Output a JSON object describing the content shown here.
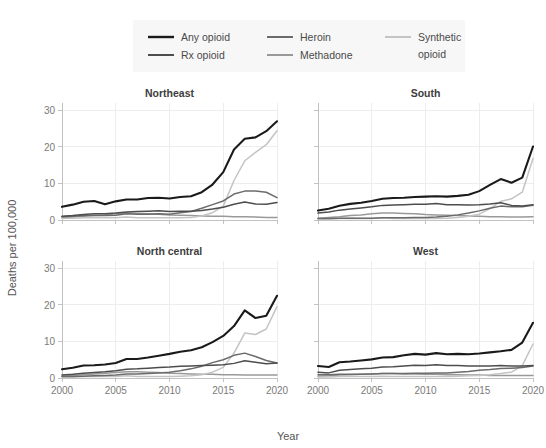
{
  "chart_data": {
    "type": "line",
    "title": "",
    "xlabel": "Year",
    "ylabel": "Deaths per 100,000",
    "xlim": [
      2000,
      2020
    ],
    "ylim": [
      0,
      32
    ],
    "grid": true,
    "legend_position": "top",
    "xticks": [
      2000,
      2005,
      2010,
      2015,
      2020
    ],
    "xtick_labels": [
      "2000",
      "2005",
      "2010",
      "2015",
      "2020"
    ],
    "yticks": [
      0,
      10,
      20,
      30
    ],
    "ytick_labels": [
      "0",
      "10",
      "20",
      "30"
    ],
    "x": [
      2000,
      2001,
      2002,
      2003,
      2004,
      2005,
      2006,
      2007,
      2008,
      2009,
      2010,
      2011,
      2012,
      2013,
      2014,
      2015,
      2016,
      2017,
      2018,
      2019,
      2020
    ],
    "series_names": [
      "Any opioid",
      "Rx opioid",
      "Heroin",
      "Methadone",
      "Synthetic opioid"
    ],
    "series_colors": {
      "Any opioid": "#1a1a1a",
      "Rx opioid": "#4d4d4d",
      "Heroin": "#6b6b6b",
      "Methadone": "#999999",
      "Synthetic opioid": "#c4c4c4"
    },
    "panels": [
      {
        "name": "Northeast",
        "row": 0,
        "col": 0,
        "series": [
          {
            "name": "Any opioid",
            "values": [
              3.6,
              4.2,
              5.0,
              5.2,
              4.3,
              5.1,
              5.6,
              5.6,
              6.0,
              6.1,
              5.9,
              6.3,
              6.5,
              7.6,
              9.7,
              13.1,
              19.3,
              22.2,
              22.6,
              24.3,
              27.0
            ]
          },
          {
            "name": "Rx opioid",
            "values": [
              1.0,
              1.2,
              1.5,
              1.7,
              1.7,
              1.9,
              2.2,
              2.3,
              2.4,
              2.5,
              2.3,
              2.4,
              2.4,
              2.6,
              3.0,
              3.5,
              4.3,
              4.9,
              4.4,
              4.3,
              4.8
            ]
          },
          {
            "name": "Heroin",
            "values": [
              0.9,
              1.0,
              1.2,
              1.2,
              1.2,
              1.3,
              1.7,
              1.6,
              1.6,
              1.7,
              1.6,
              2.0,
              2.3,
              3.2,
              4.2,
              5.2,
              7.1,
              7.9,
              7.9,
              7.6,
              6.1
            ]
          },
          {
            "name": "Methadone",
            "values": [
              0.6,
              0.8,
              1.0,
              1.3,
              1.4,
              1.7,
              1.9,
              1.8,
              1.7,
              1.6,
              1.4,
              1.3,
              1.2,
              1.1,
              1.0,
              1.0,
              0.9,
              0.9,
              0.8,
              0.7,
              0.7
            ]
          },
          {
            "name": "Synthetic opioid",
            "values": [
              0.5,
              0.5,
              0.6,
              0.7,
              0.6,
              0.6,
              0.8,
              0.6,
              0.6,
              0.6,
              0.6,
              0.6,
              0.7,
              1.1,
              2.0,
              3.8,
              10.8,
              16.2,
              18.5,
              20.6,
              24.4
            ]
          }
        ]
      },
      {
        "name": "South",
        "row": 0,
        "col": 1,
        "series": [
          {
            "name": "Any opioid",
            "values": [
              2.6,
              3.1,
              3.9,
              4.4,
              4.7,
              5.2,
              5.8,
              6.0,
              6.1,
              6.3,
              6.4,
              6.5,
              6.4,
              6.6,
              6.9,
              7.9,
              9.6,
              11.2,
              10.2,
              11.6,
              20.1
            ]
          },
          {
            "name": "Rx opioid",
            "values": [
              1.9,
              2.2,
              2.7,
              3.0,
              3.3,
              3.6,
              4.0,
              4.1,
              4.2,
              4.3,
              4.3,
              4.5,
              4.2,
              4.2,
              4.1,
              4.2,
              4.4,
              4.7,
              4.0,
              3.8,
              4.2
            ]
          },
          {
            "name": "Heroin",
            "values": [
              0.4,
              0.4,
              0.5,
              0.5,
              0.5,
              0.5,
              0.6,
              0.6,
              0.6,
              0.7,
              0.7,
              0.8,
              1.0,
              1.4,
              1.9,
              2.5,
              3.2,
              3.8,
              3.6,
              3.6,
              4.0
            ]
          },
          {
            "name": "Methadone",
            "values": [
              0.5,
              0.7,
              0.9,
              1.2,
              1.4,
              1.7,
              1.9,
              1.9,
              1.8,
              1.7,
              1.5,
              1.4,
              1.3,
              1.2,
              1.1,
              1.0,
              0.9,
              0.9,
              0.8,
              0.8,
              0.9
            ]
          },
          {
            "name": "Synthetic opioid",
            "values": [
              0.3,
              0.3,
              0.4,
              0.5,
              0.4,
              0.4,
              0.6,
              0.4,
              0.4,
              0.4,
              0.4,
              0.4,
              0.5,
              0.7,
              1.0,
              1.6,
              3.1,
              5.1,
              5.8,
              7.6,
              16.8
            ]
          }
        ]
      },
      {
        "name": "North central",
        "row": 1,
        "col": 0,
        "series": [
          {
            "name": "Any opioid",
            "values": [
              2.4,
              2.8,
              3.4,
              3.5,
              3.7,
              4.1,
              5.2,
              5.2,
              5.6,
              6.1,
              6.6,
              7.2,
              7.6,
              8.4,
              9.8,
              11.5,
              14.2,
              18.5,
              16.4,
              17.0,
              22.5
            ]
          },
          {
            "name": "Rx opioid",
            "values": [
              0.8,
              1.0,
              1.3,
              1.5,
              1.7,
              2.0,
              2.4,
              2.5,
              2.7,
              2.9,
              3.0,
              3.2,
              3.3,
              3.4,
              3.5,
              3.6,
              4.0,
              4.7,
              4.3,
              3.9,
              4.1
            ]
          },
          {
            "name": "Heroin",
            "values": [
              0.4,
              0.4,
              0.5,
              0.6,
              0.7,
              0.8,
              1.1,
              1.1,
              1.2,
              1.4,
              1.6,
              2.0,
              2.5,
              3.2,
              4.2,
              5.0,
              6.2,
              6.8,
              5.9,
              4.8,
              4.1
            ]
          },
          {
            "name": "Methadone",
            "values": [
              0.5,
              0.7,
              0.9,
              1.1,
              1.3,
              1.5,
              1.7,
              1.7,
              1.6,
              1.5,
              1.3,
              1.2,
              1.1,
              1.0,
              1.0,
              0.9,
              0.9,
              0.8,
              0.8,
              0.8,
              0.8
            ]
          },
          {
            "name": "Synthetic opioid",
            "values": [
              0.3,
              0.3,
              0.4,
              0.4,
              0.4,
              0.4,
              0.6,
              0.4,
              0.4,
              0.4,
              0.4,
              0.5,
              0.6,
              0.9,
              1.6,
              2.9,
              6.8,
              12.3,
              11.9,
              13.4,
              19.5
            ]
          }
        ]
      },
      {
        "name": "West",
        "row": 1,
        "col": 1,
        "series": [
          {
            "name": "Any opioid",
            "values": [
              3.3,
              3.0,
              4.3,
              4.5,
              4.8,
              5.1,
              5.6,
              5.7,
              6.2,
              6.6,
              6.4,
              6.8,
              6.5,
              6.6,
              6.5,
              6.7,
              7.0,
              7.3,
              7.7,
              9.7,
              15.1
            ]
          },
          {
            "name": "Rx opioid",
            "values": [
              1.6,
              1.4,
              2.1,
              2.3,
              2.5,
              2.7,
              3.0,
              3.1,
              3.3,
              3.5,
              3.4,
              3.6,
              3.4,
              3.4,
              3.3,
              3.3,
              3.3,
              3.4,
              3.3,
              3.3,
              3.4
            ]
          },
          {
            "name": "Heroin",
            "values": [
              0.9,
              0.9,
              1.0,
              1.0,
              1.0,
              1.1,
              1.2,
              1.2,
              1.2,
              1.3,
              1.3,
              1.4,
              1.4,
              1.6,
              1.8,
              2.1,
              2.3,
              2.6,
              2.7,
              2.9,
              3.3
            ]
          },
          {
            "name": "Methadone",
            "values": [
              0.5,
              0.6,
              0.8,
              0.9,
              1.0,
              1.1,
              1.2,
              1.2,
              1.1,
              1.1,
              1.0,
              1.0,
              0.9,
              0.9,
              0.8,
              0.8,
              0.7,
              0.7,
              0.7,
              0.7,
              0.7
            ]
          },
          {
            "name": "Synthetic opioid",
            "values": [
              0.3,
              0.3,
              0.4,
              0.4,
              0.4,
              0.4,
              0.5,
              0.4,
              0.4,
              0.4,
              0.4,
              0.4,
              0.4,
              0.5,
              0.6,
              0.7,
              0.9,
              1.2,
              1.6,
              3.4,
              9.3
            ]
          }
        ]
      }
    ]
  },
  "legend": {
    "background": "#f7f7f7",
    "entries": [
      {
        "label": "Any opioid",
        "color": "#1a1a1a",
        "row": 0,
        "col": 0
      },
      {
        "label": "Rx opioid",
        "color": "#4d4d4d",
        "row": 1,
        "col": 0
      },
      {
        "label": "Heroin",
        "color": "#6b6b6b",
        "row": 0,
        "col": 1
      },
      {
        "label": "Methadone",
        "color": "#999999",
        "row": 1,
        "col": 1
      },
      {
        "label": "Synthetic opioid",
        "color": "#c4c4c4",
        "row": 0,
        "col": 2
      }
    ]
  }
}
